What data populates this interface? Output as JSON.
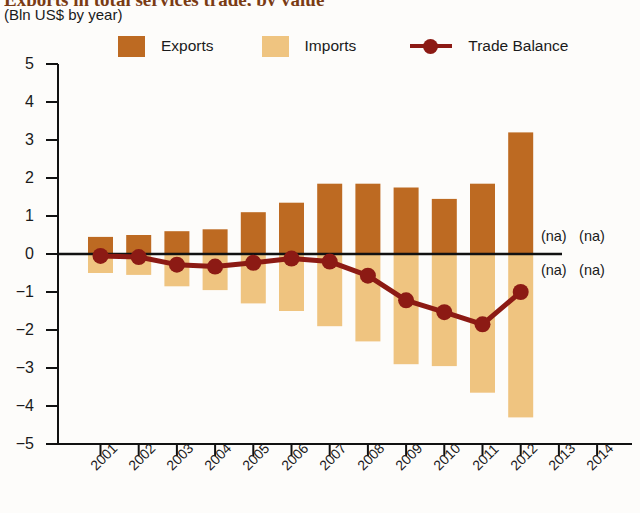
{
  "header": {
    "title": "Exports in total services trade, by value",
    "subtitle": "(Bln US$ by year)"
  },
  "legend": {
    "position": "top",
    "items": [
      {
        "label": "Exports",
        "color": "#bd6a22",
        "kind": "swatch",
        "icon": "square-swatch"
      },
      {
        "label": "Imports",
        "color": "#efc480",
        "kind": "swatch",
        "icon": "square-swatch"
      },
      {
        "label": "Trade Balance",
        "color": "#8c1a14",
        "kind": "line",
        "icon": "line-marker"
      }
    ]
  },
  "annotations": [
    {
      "text": "(na)",
      "year": "2013",
      "side": "above"
    },
    {
      "text": "(na)",
      "year": "2014",
      "side": "above"
    },
    {
      "text": "(na)",
      "year": "2013",
      "side": "below"
    },
    {
      "text": "(na)",
      "year": "2014",
      "side": "below"
    }
  ],
  "chart_data": {
    "type": "bar",
    "title": "Exports in total services trade, by value",
    "subtitle": "(Bln US$ by year)",
    "xlabel": "",
    "ylabel": "",
    "ylim": [
      -5,
      5
    ],
    "yticks": [
      "5",
      "4",
      "3",
      "2",
      "1",
      "0",
      "−1",
      "−2",
      "−3",
      "−4",
      "−5"
    ],
    "ytick_values": [
      5,
      4,
      3,
      2,
      1,
      0,
      -1,
      -2,
      -3,
      -4,
      -5
    ],
    "grid": false,
    "zero_line": true,
    "categories": [
      "2001",
      "2002",
      "2003",
      "2004",
      "2005",
      "2006",
      "2007",
      "2008",
      "2009",
      "2010",
      "2011",
      "2012",
      "2013",
      "2014"
    ],
    "series": [
      {
        "name": "Exports",
        "type": "bar",
        "color": "#bd6a22",
        "values": [
          0.45,
          0.5,
          0.6,
          0.65,
          1.1,
          1.35,
          1.85,
          1.85,
          1.75,
          1.45,
          1.85,
          3.2,
          null,
          null
        ]
      },
      {
        "name": "Imports",
        "type": "bar",
        "color": "#efc480",
        "values": [
          -0.5,
          -0.55,
          -0.85,
          -0.95,
          -1.3,
          -1.5,
          -1.9,
          -2.3,
          -2.9,
          -2.95,
          -3.65,
          -4.3,
          null,
          null
        ]
      },
      {
        "name": "Trade Balance",
        "type": "line",
        "color": "#8c1a14",
        "values": [
          -0.05,
          -0.08,
          -0.28,
          -0.33,
          -0.23,
          -0.12,
          -0.2,
          -0.57,
          -1.22,
          -1.53,
          -1.85,
          -1.0,
          null,
          null
        ]
      }
    ]
  }
}
